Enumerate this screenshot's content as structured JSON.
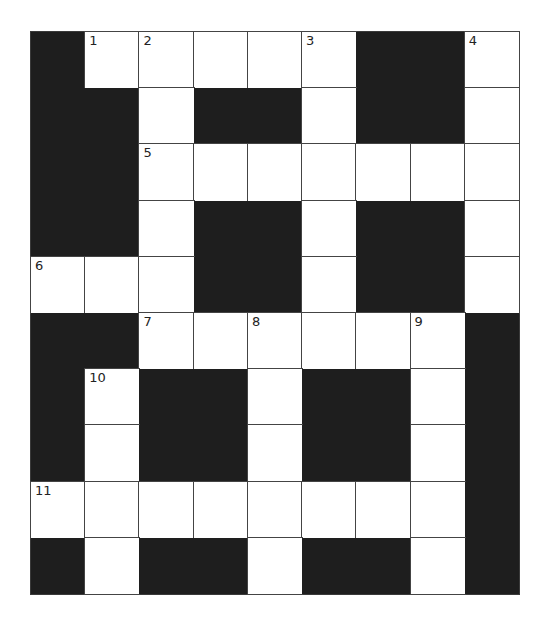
{
  "puzzle": {
    "type": "crossword",
    "rows": 10,
    "cols": 9,
    "colors": {
      "block": "#1e1e1e",
      "open": "#ffffff",
      "line": "#444444"
    },
    "grid": [
      [
        "#",
        "1",
        "2",
        ".",
        ".",
        "3",
        "#",
        "#",
        "4"
      ],
      [
        "#",
        "#",
        ".",
        "#",
        "#",
        ".",
        "#",
        "#",
        "."
      ],
      [
        "#",
        "#",
        "5",
        ".",
        ".",
        ".",
        ".",
        ".",
        "."
      ],
      [
        "#",
        "#",
        ".",
        "#",
        "#",
        ".",
        "#",
        "#",
        "."
      ],
      [
        "6",
        ".",
        ".",
        "#",
        "#",
        ".",
        "#",
        "#",
        "."
      ],
      [
        "#",
        "#",
        "7",
        ".",
        "8",
        ".",
        ".",
        "9",
        "#"
      ],
      [
        "#",
        "10",
        "#",
        "#",
        ".",
        "#",
        "#",
        ".",
        "#"
      ],
      [
        "#",
        ".",
        "#",
        "#",
        ".",
        "#",
        "#",
        ".",
        "#"
      ],
      [
        "11",
        ".",
        ".",
        ".",
        ".",
        ".",
        ".",
        ".",
        "#"
      ],
      [
        "#",
        ".",
        "#",
        "#",
        ".",
        "#",
        "#",
        ".",
        "#"
      ]
    ],
    "clue_numbers": [
      "1",
      "2",
      "3",
      "4",
      "5",
      "6",
      "7",
      "8",
      "9",
      "10",
      "11"
    ]
  }
}
